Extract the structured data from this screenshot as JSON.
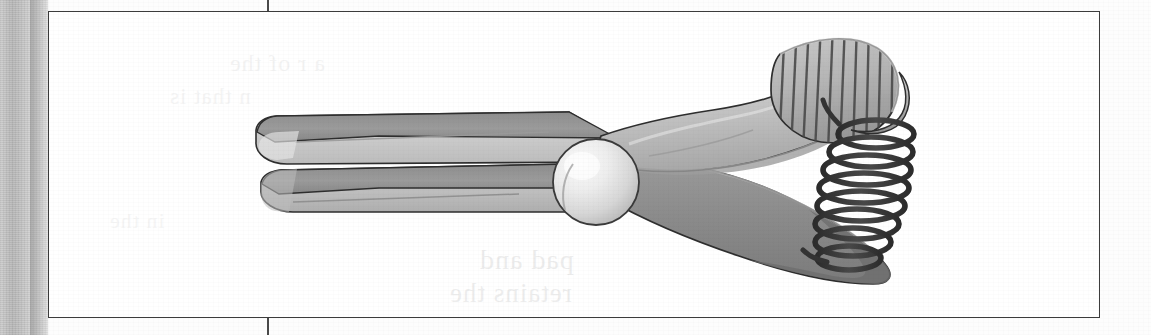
{
  "page": {
    "background_color": "#fdfdfd",
    "scan_edge_color": "#c3c3c3",
    "crop_mark_color": "#4a4a4a",
    "caption": ""
  },
  "figure": {
    "frame": {
      "border_color": "#3c3c3c",
      "fill_color": "#ffffff"
    },
    "title": "",
    "description": "Grayscale technical illustration of a spring clothespin clip shown in side view, with two tapered jaws at left, a central pivot sphere, ribbed thumb grip at upper right, and a coiled torsion spring at the right end.",
    "parts": [
      {
        "name": "upper-jaw",
        "label": "Upper jaw"
      },
      {
        "name": "lower-jaw",
        "label": "Lower jaw"
      },
      {
        "name": "pivot-sphere",
        "label": "Pivot sphere"
      },
      {
        "name": "upper-handle",
        "label": "Upper handle"
      },
      {
        "name": "lower-handle",
        "label": "Lower handle"
      },
      {
        "name": "ribbed-grip",
        "label": "Ribbed thumb grip"
      },
      {
        "name": "torsion-spring",
        "label": "Coiled torsion spring"
      }
    ],
    "palette": {
      "outline": "#2e2e2e",
      "dark_gray": "#7f7f7f",
      "mid_gray": "#a3a3a3",
      "light_gray": "#c8c8c8",
      "pale_gray": "#dedede",
      "highlight": "#f2f2f2",
      "spring": "#3a3a3a",
      "shadow_gray": "#6e6e6e"
    },
    "ghost_text": {
      "line1": "a r of the",
      "line2": "n that is",
      "line3": "pad and",
      "line4": "retains the",
      "line5": "in the"
    }
  }
}
